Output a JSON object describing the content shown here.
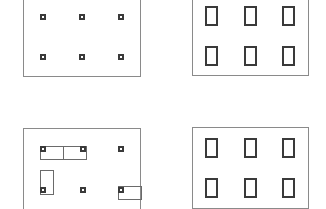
{
  "diagram": {
    "title": "",
    "panels": [
      {
        "id": "top-left",
        "description": "Frame with 2x3 grid of small square markers",
        "rows": 2,
        "cols": 3,
        "element": "small-square-marker"
      },
      {
        "id": "top-right",
        "description": "Frame with 2x3 grid of tall rectangular cells",
        "rows": 2,
        "cols": 3,
        "element": "tall-rectangle"
      },
      {
        "id": "bottom-left",
        "description": "Frame with 2x3 grid of small square markers, some with thin attached rectangles",
        "rows": 2,
        "cols": 3,
        "element": "small-square-marker",
        "attachments": [
          {
            "anchor": "row1-col1",
            "shape": "horizontal-rect",
            "direction": "right"
          },
          {
            "anchor": "row1-col2",
            "shape": "horizontal-rect",
            "direction": "left"
          },
          {
            "anchor": "row2-col1",
            "shape": "vertical-rect",
            "direction": "up"
          },
          {
            "anchor": "row2-col3",
            "shape": "horizontal-rect",
            "direction": "right"
          }
        ]
      },
      {
        "id": "bottom-right",
        "description": "Frame with 2x3 grid of tall rectangular cells",
        "rows": 2,
        "cols": 3,
        "element": "tall-rectangle"
      }
    ],
    "colors": {
      "frame": "#8a8a8a",
      "marker": "#3a3a3a",
      "thin_rect": "#6a6a6a",
      "background": "#ffffff"
    }
  }
}
